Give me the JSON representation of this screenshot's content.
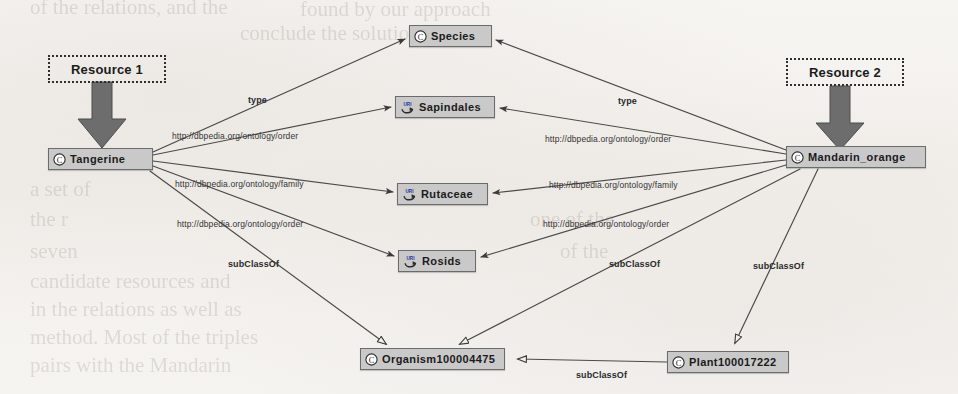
{
  "diagram": {
    "background_color": "#f4f2ef",
    "node_fill": "#c9c9c9",
    "node_stroke": "#6b6b6b",
    "edge_color": "#4a4a4a"
  },
  "annotations": [
    {
      "id": "resource1",
      "label": "Resource 1",
      "x": 48,
      "y": 55,
      "width": 118,
      "height": 28
    },
    {
      "id": "resource2",
      "label": "Resource 2",
      "x": 786,
      "y": 58,
      "width": 118,
      "height": 28
    }
  ],
  "nodes": [
    {
      "id": "tangerine",
      "label": "Tangerine",
      "icon": "class-c-icon",
      "x": 48,
      "y": 148,
      "width": 105,
      "height": 22
    },
    {
      "id": "mandarin",
      "label": "Mandarin_orange",
      "icon": "class-c-icon",
      "x": 786,
      "y": 146,
      "width": 140,
      "height": 22
    },
    {
      "id": "species",
      "label": "Species",
      "icon": "class-c-icon",
      "x": 409,
      "y": 25,
      "width": 83,
      "height": 22
    },
    {
      "id": "sapindales",
      "label": "Sapindales",
      "icon": "uri-icon",
      "x": 395,
      "y": 96,
      "width": 100,
      "height": 22
    },
    {
      "id": "rutaceae",
      "label": "Rutaceae",
      "icon": "uri-icon",
      "x": 397,
      "y": 183,
      "width": 91,
      "height": 22
    },
    {
      "id": "rosids",
      "label": "Rosids",
      "icon": "uri-icon",
      "x": 398,
      "y": 250,
      "width": 78,
      "height": 22
    },
    {
      "id": "organism",
      "label": "Organism100004475",
      "icon": "class-c-icon",
      "x": 360,
      "y": 348,
      "width": 145,
      "height": 22
    },
    {
      "id": "plant",
      "label": "Plant100017222",
      "icon": "class-c-icon",
      "x": 667,
      "y": 351,
      "width": 122,
      "height": 22
    }
  ],
  "edges": [
    {
      "id": "e1",
      "from": "tangerine",
      "to": "species",
      "label": "type",
      "label_x": 248,
      "label_y": 95,
      "bold": true
    },
    {
      "id": "e2",
      "from": "tangerine",
      "to": "sapindales",
      "label": "http://dbpedia.org/ontology/order",
      "label_x": 172,
      "label_y": 131,
      "bold": false
    },
    {
      "id": "e3",
      "from": "tangerine",
      "to": "rutaceae",
      "label": "http://dbpedia.org/ontology/family",
      "label_x": 175,
      "label_y": 179,
      "bold": false
    },
    {
      "id": "e4",
      "from": "tangerine",
      "to": "rosids",
      "label": "http://dbpedia.org/ontology/order",
      "label_x": 177,
      "label_y": 219,
      "bold": false
    },
    {
      "id": "e5",
      "from": "tangerine",
      "to": "organism",
      "label": "subClassOf",
      "label_x": 228,
      "label_y": 259,
      "bold": true
    },
    {
      "id": "e6",
      "from": "mandarin",
      "to": "species",
      "label": "type",
      "label_x": 618,
      "label_y": 96,
      "bold": true
    },
    {
      "id": "e7",
      "from": "mandarin",
      "to": "sapindales",
      "label": "http://dbpedia.org/ontology/order",
      "label_x": 545,
      "label_y": 134,
      "bold": false
    },
    {
      "id": "e8",
      "from": "mandarin",
      "to": "rutaceae",
      "label": "http://dbpedia.org/ontology/family",
      "label_x": 549,
      "label_y": 180,
      "bold": false
    },
    {
      "id": "e9",
      "from": "mandarin",
      "to": "rosids",
      "label": "http://dbpedia.org/ontology/order",
      "label_x": 543,
      "label_y": 219,
      "bold": false
    },
    {
      "id": "e10",
      "from": "mandarin",
      "to": "organism",
      "label": "subClassOf",
      "label_x": 609,
      "label_y": 259,
      "bold": true
    },
    {
      "id": "e11",
      "from": "mandarin",
      "to": "plant",
      "label": "subClassOf",
      "label_x": 753,
      "label_y": 261,
      "bold": true
    },
    {
      "id": "e12",
      "from": "plant",
      "to": "organism",
      "label": "subClassOf",
      "label_x": 576,
      "label_y": 370,
      "bold": true
    }
  ]
}
